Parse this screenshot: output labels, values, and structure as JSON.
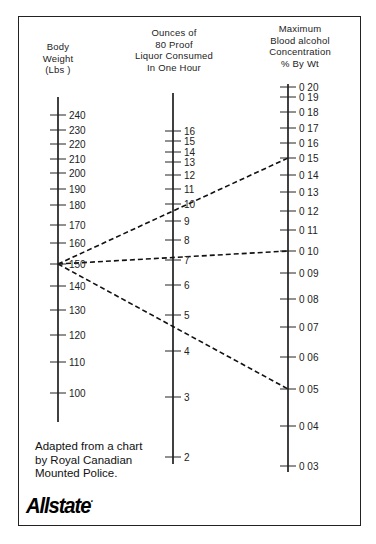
{
  "headers": {
    "weight": [
      "Body",
      "Weight",
      "(Lbs )"
    ],
    "ounces": [
      "Ounces of",
      "80 Proof",
      "Liquor Consumed",
      "In One Hour"
    ],
    "bac": [
      "Maximum",
      "Blood alcohol",
      "Concentration",
      "% By Wt"
    ]
  },
  "credit": [
    "Adapted from a chart",
    "by Royal Canadian",
    "Mounted Police."
  ],
  "logo": "Allstate",
  "chart_data": {
    "type": "nomogram",
    "title": "",
    "axes": [
      {
        "name": "Body Weight (Lbs)",
        "x": 58,
        "y_top": 97,
        "y_bottom": 422,
        "ticks": [
          {
            "label": "240",
            "y": 115
          },
          {
            "label": "230",
            "y": 130
          },
          {
            "label": "220",
            "y": 144
          },
          {
            "label": "210",
            "y": 159
          },
          {
            "label": "200",
            "y": 173
          },
          {
            "label": "190",
            "y": 189
          },
          {
            "label": "180",
            "y": 205
          },
          {
            "label": "170",
            "y": 225
          },
          {
            "label": "160",
            "y": 243
          },
          {
            "label": "150",
            "y": 264
          },
          {
            "label": "140",
            "y": 286
          },
          {
            "label": "130",
            "y": 310
          },
          {
            "label": "120",
            "y": 335
          },
          {
            "label": "110",
            "y": 362
          },
          {
            "label": "100",
            "y": 393
          }
        ]
      },
      {
        "name": "Ounces of 80 Proof Liquor Consumed In One Hour",
        "x": 173,
        "y_top": 93,
        "y_bottom": 464,
        "ticks": [
          {
            "label": "16",
            "y": 131
          },
          {
            "label": "15",
            "y": 141
          },
          {
            "label": "14",
            "y": 152
          },
          {
            "label": "13",
            "y": 162
          },
          {
            "label": "12",
            "y": 175
          },
          {
            "label": "11",
            "y": 189
          },
          {
            "label": "10",
            "y": 204
          },
          {
            "label": "9",
            "y": 221
          },
          {
            "label": "8",
            "y": 240
          },
          {
            "label": "7",
            "y": 260
          },
          {
            "label": "6",
            "y": 285
          },
          {
            "label": "5",
            "y": 315
          },
          {
            "label": "4",
            "y": 351
          },
          {
            "label": "3",
            "y": 397
          },
          {
            "label": "2",
            "y": 457
          }
        ]
      },
      {
        "name": "Maximum Blood alcohol Concentration % By Wt",
        "x": 288,
        "y_top": 84,
        "y_bottom": 472,
        "ticks": [
          {
            "label": "0 20",
            "y": 87
          },
          {
            "label": "0 19",
            "y": 97
          },
          {
            "label": "0 18",
            "y": 112
          },
          {
            "label": "0 17",
            "y": 128
          },
          {
            "label": "0 16",
            "y": 143
          },
          {
            "label": "0 15",
            "y": 158
          },
          {
            "label": "0 14",
            "y": 175
          },
          {
            "label": "0 13",
            "y": 192
          },
          {
            "label": "0 12",
            "y": 211
          },
          {
            "label": "0 11",
            "y": 230
          },
          {
            "label": "0 10",
            "y": 251
          },
          {
            "label": "0 09",
            "y": 273
          },
          {
            "label": "0 08",
            "y": 299
          },
          {
            "label": "0 07",
            "y": 327
          },
          {
            "label": "0 06",
            "y": 357
          },
          {
            "label": "0 05",
            "y": 389
          },
          {
            "label": "0 04",
            "y": 426
          },
          {
            "label": "0 03",
            "y": 466
          }
        ]
      }
    ],
    "example_lines": [
      {
        "weight_lbs": 150,
        "ounces": 10,
        "bac": 0.15,
        "x1": 58,
        "y1": 264,
        "x2": 288,
        "y2": 158
      },
      {
        "weight_lbs": 150,
        "ounces": 7,
        "bac": 0.1,
        "x1": 58,
        "y1": 264,
        "x2": 288,
        "y2": 251
      },
      {
        "weight_lbs": 150,
        "ounces": 4.5,
        "bac": 0.05,
        "x1": 58,
        "y1": 264,
        "x2": 288,
        "y2": 389
      }
    ],
    "grid": false,
    "legend": null
  }
}
